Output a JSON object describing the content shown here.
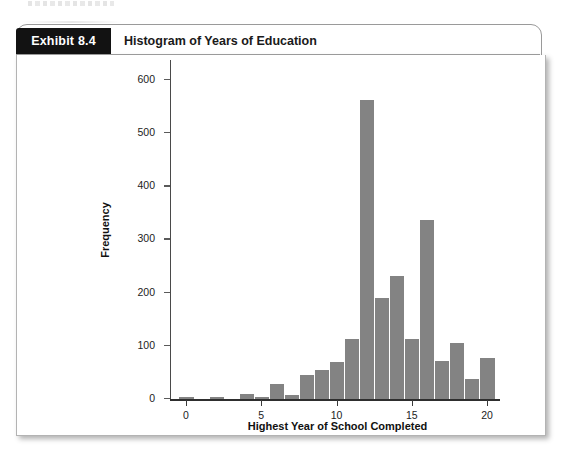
{
  "exhibit": {
    "tag_label": "Exhibit 8.4",
    "title": "Histogram of Years of Education"
  },
  "colors": {
    "bar": "#838383",
    "tag_background": "#121212",
    "tag_text": "#ffffff",
    "panel_background": "#ffffff",
    "axis": "#2e2e2e"
  },
  "chart_data": {
    "type": "bar",
    "title": "Histogram of Years of Education",
    "xlabel": "Highest Year of School Completed",
    "ylabel": "Frequency",
    "xlim": [
      -1,
      21
    ],
    "ylim": [
      0,
      640
    ],
    "grid": false,
    "legend": null,
    "x_ticks": [
      "0",
      "5",
      "10",
      "15",
      "20"
    ],
    "x_tick_values": [
      0,
      5,
      10,
      15,
      20
    ],
    "y_ticks": [
      "0",
      "100",
      "200",
      "300",
      "400",
      "500",
      "600"
    ],
    "y_tick_values": [
      0,
      100,
      200,
      300,
      400,
      500,
      600
    ],
    "categories": [
      0,
      1,
      2,
      3,
      4,
      5,
      6,
      7,
      8,
      9,
      10,
      11,
      12,
      13,
      14,
      15,
      16,
      17,
      18,
      19,
      20
    ],
    "values": [
      4,
      0,
      4,
      0,
      10,
      2,
      28,
      8,
      45,
      55,
      70,
      113,
      562,
      190,
      232,
      113,
      337,
      72,
      105,
      38,
      77
    ],
    "bar_width_units": 1
  }
}
